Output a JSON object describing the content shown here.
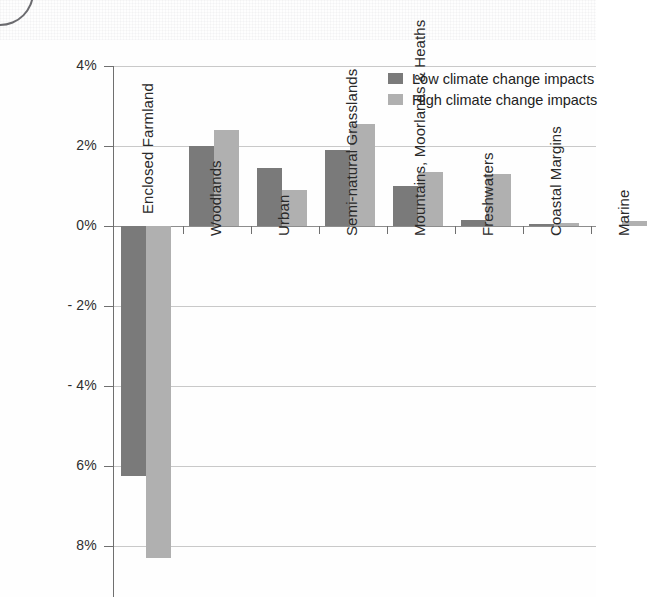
{
  "chart_data": {
    "type": "bar",
    "title": "",
    "subtitle": "",
    "xlabel": "",
    "ylabel": "",
    "ylim": [
      -8.6,
      4.0
    ],
    "grid": true,
    "legend_position": "top-right",
    "y_ticks": [
      "4%",
      "2%",
      "0%",
      "- 2%",
      "- 4%",
      "6%",
      "8%"
    ],
    "y_tick_values": [
      4,
      2,
      0,
      -2,
      -4,
      -6,
      -8
    ],
    "categories": [
      "Enclosed Farmland",
      "Woodlands",
      "Urban",
      "Semi-natural Grasslands",
      "Mountains, Moorlands & Heaths",
      "Freshwaters",
      "Coastal Margins",
      "Marine"
    ],
    "series": [
      {
        "name": "Low climate change impacts",
        "color": "#7a7a7a",
        "values": [
          -6.25,
          2.0,
          1.45,
          1.9,
          1.0,
          0.15,
          0.05,
          0.0
        ]
      },
      {
        "name": "High climate change impacts",
        "color": "#b0b0b0",
        "values": [
          -8.3,
          2.4,
          0.9,
          2.55,
          1.35,
          1.3,
          0.07,
          0.12
        ]
      }
    ]
  },
  "legend": {
    "items": [
      {
        "label": "Low climate change impacts",
        "swatch": "low"
      },
      {
        "label": "High climate change impacts",
        "swatch": "high"
      }
    ]
  }
}
